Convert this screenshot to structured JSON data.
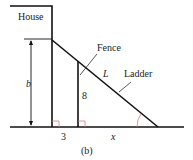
{
  "labels": {
    "house": "House",
    "fence": "Fence",
    "ladder": "Ladder",
    "length": "L",
    "height": "b",
    "fence_height": "8",
    "fence_distance": "3",
    "ground_distance": "x",
    "caption": "(b)"
  },
  "colors": {
    "line": "#111111",
    "right_angle_mark": "#d08080",
    "angle_arc": "#d08080"
  }
}
